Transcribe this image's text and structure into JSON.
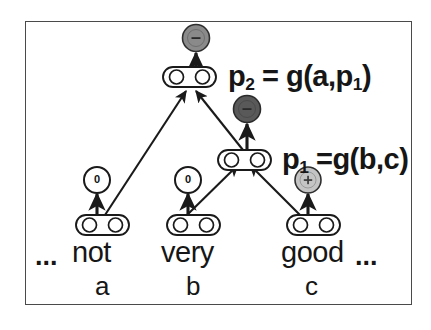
{
  "figure": {
    "background_color": "#ffffff",
    "frame_color": "#4a4a4a"
  },
  "sentence": {
    "leading_ellipsis": "...",
    "trailing_ellipsis": "...",
    "words": [
      {
        "text": "not",
        "variable": "a"
      },
      {
        "text": "very",
        "variable": "b"
      },
      {
        "text": "good",
        "variable": "c"
      }
    ]
  },
  "equations": {
    "p2": {
      "lhs": "p",
      "lhs_sub": "2",
      "rhs": " = g(a,p",
      "rhs_sub": "1",
      "rhs_tail": ")"
    },
    "p1": {
      "lhs": "p",
      "lhs_sub": "1",
      "rhs": " =g(b,c)",
      "rhs_sub": "",
      "rhs_tail": ""
    }
  },
  "sentiment_nodes": [
    {
      "id": "leaf-a-sentiment",
      "label": "0",
      "fill": "#ffffff",
      "text_color": "#111111"
    },
    {
      "id": "leaf-b-sentiment",
      "label": "0",
      "fill": "#ffffff",
      "text_color": "#111111"
    },
    {
      "id": "leaf-c-sentiment",
      "label": "+",
      "fill": "#c4c4c4",
      "text_color": "#333333"
    },
    {
      "id": "p1-sentiment",
      "label": "-",
      "fill": "#595959",
      "text_color": "#2a2a2a"
    },
    {
      "id": "p2-sentiment",
      "label": "-",
      "fill": "#8a8a8a",
      "text_color": "#2a2a2a"
    }
  ],
  "vector_boxes": [
    {
      "id": "vector-a",
      "units": 2
    },
    {
      "id": "vector-b",
      "units": 2
    },
    {
      "id": "vector-c",
      "units": 2
    },
    {
      "id": "vector-p1",
      "units": 2
    },
    {
      "id": "vector-p2",
      "units": 2
    }
  ],
  "colors": {
    "stroke": "#1a1a1a",
    "negative_strong": "#595959",
    "negative_weak": "#8a8a8a",
    "positive_weak": "#c4c4c4",
    "neutral": "#ffffff"
  }
}
